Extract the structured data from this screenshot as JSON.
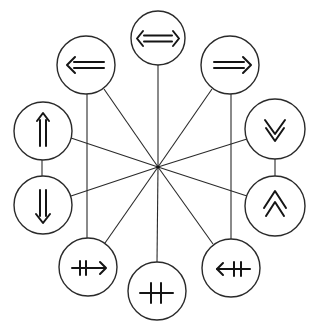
{
  "diagram": {
    "type": "radial-symbol-diagram",
    "hub": {
      "x": 158,
      "y": 167
    },
    "colors": {
      "stroke": "#2a2a2a",
      "glyph": "#151515",
      "background": "#ffffff"
    },
    "nodes": [
      {
        "id": "top",
        "symbol": "double-arrow-left-right",
        "unicode": "⇔",
        "x": 158,
        "y": 38,
        "r": 27
      },
      {
        "id": "upper-left",
        "symbol": "double-arrow-left",
        "unicode": "⇐",
        "x": 86,
        "y": 65,
        "r": 29
      },
      {
        "id": "upper-right",
        "symbol": "double-arrow-right",
        "unicode": "⇒",
        "x": 230,
        "y": 65,
        "r": 29
      },
      {
        "id": "left-upper",
        "symbol": "double-arrow-up",
        "unicode": "⇑",
        "x": 43,
        "y": 131,
        "r": 29
      },
      {
        "id": "left-lower",
        "symbol": "double-arrow-down",
        "unicode": "⇓",
        "x": 43,
        "y": 205,
        "r": 29
      },
      {
        "id": "right-upper",
        "symbol": "double-chevron-down",
        "unicode": "⩔",
        "x": 275,
        "y": 129,
        "r": 30
      },
      {
        "id": "right-lower",
        "symbol": "double-chevron-up",
        "unicode": "⩓",
        "x": 275,
        "y": 206,
        "r": 30
      },
      {
        "id": "lower-left",
        "symbol": "crossed-arrow-right",
        "unicode": "⇸",
        "x": 88,
        "y": 267,
        "r": 29
      },
      {
        "id": "bottom",
        "symbol": "double-crossed-line",
        "unicode": "⧺",
        "x": 157,
        "y": 291,
        "r": 29
      },
      {
        "id": "lower-right",
        "symbol": "crossed-arrow-left",
        "unicode": "⇷",
        "x": 231,
        "y": 268,
        "r": 29
      }
    ],
    "spokes": [
      "top",
      "upper-left",
      "upper-right",
      "left-upper",
      "left-lower",
      "right-upper",
      "right-lower",
      "lower-left",
      "bottom",
      "lower-right"
    ],
    "extra_edges": [
      {
        "from": "upper-left",
        "to": "lower-left",
        "style": "vertical"
      },
      {
        "from": "upper-right",
        "to": "lower-right",
        "style": "vertical"
      },
      {
        "from": "left-upper",
        "to": "left-lower",
        "style": "vertical"
      },
      {
        "from": "right-upper",
        "to": "right-lower",
        "style": "vertical"
      }
    ]
  }
}
